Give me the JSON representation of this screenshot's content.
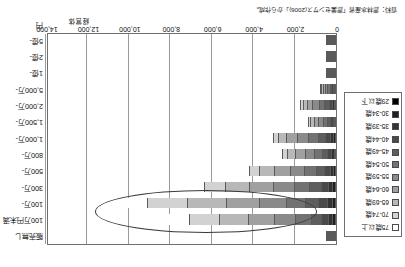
{
  "figure": {
    "source_note": "資料：農林水産省「農業センサス(2006)」から作成。",
    "axis_unit": "経営体",
    "y_axis_unit": "円"
  },
  "chart_data": {
    "type": "bar",
    "subtype": "stacked-horizontal-bar",
    "title": "",
    "xlabel": "経営体",
    "ylabel": "円",
    "xlim": [
      0,
      14000
    ],
    "grid": true,
    "legend_position": "left",
    "xticks": [
      0,
      2000,
      4000,
      6000,
      8000,
      10000,
      12000,
      14000
    ],
    "xtick_labels": [
      "0",
      "2,000",
      "4,000",
      "6,000",
      "8,000",
      "10,000",
      "12,000",
      "14,000"
    ],
    "categories": [
      "販売無し",
      "100万円未満",
      "100万-",
      "300万-",
      "500万-",
      "800万-",
      "1,000万-",
      "1,500万-",
      "2,000万-",
      "5,000万-",
      "1億-",
      "2億-",
      "5億-"
    ],
    "series": [
      {
        "name": "29歳以下",
        "color": "#000000",
        "values": [
          55,
          60,
          70,
          62,
          50,
          40,
          55,
          28,
          35,
          22,
          10,
          6,
          4
        ]
      },
      {
        "name": "30-34歳",
        "color": "#1f1f1f",
        "values": [
          30,
          120,
          140,
          120,
          95,
          70,
          95,
          45,
          60,
          35,
          14,
          7,
          4
        ]
      },
      {
        "name": "35-39歳",
        "color": "#333333",
        "values": [
          25,
          200,
          240,
          210,
          160,
          115,
          150,
          70,
          95,
          50,
          18,
          8,
          4
        ]
      },
      {
        "name": "40-44歳",
        "color": "#4a4a4a",
        "values": [
          20,
          330,
          400,
          350,
          265,
          185,
          235,
          110,
          150,
          72,
          22,
          9,
          4
        ]
      },
      {
        "name": "45-49歳",
        "color": "#5e5e5e",
        "values": [
          18,
          520,
          640,
          545,
          410,
          280,
          350,
          160,
          215,
          95,
          26,
          10,
          4
        ]
      },
      {
        "name": "50-54歳",
        "color": "#727272",
        "values": [
          16,
          760,
          930,
          760,
          560,
          370,
          455,
          205,
          270,
          112,
          28,
          10,
          3
        ]
      },
      {
        "name": "55-59歳",
        "color": "#8a8a8a",
        "values": [
          15,
          1010,
          1280,
          1000,
          700,
          445,
          530,
          230,
          300,
          120,
          28,
          9,
          3
        ]
      },
      {
        "name": "60-64歳",
        "color": "#a0a0a0",
        "values": [
          14,
          1230,
          1620,
          1150,
          760,
          460,
          525,
          215,
          275,
          105,
          24,
          7,
          2
        ]
      },
      {
        "name": "65-69歳",
        "color": "#b8b8b8",
        "values": [
          12,
          1410,
          1900,
          1180,
          700,
          390,
          420,
          160,
          200,
          72,
          16,
          5,
          2
        ]
      },
      {
        "name": "70-74歳",
        "color": "#d2d2d2",
        "values": [
          10,
          1480,
          1900,
          980,
          500,
          250,
          250,
          90,
          110,
          38,
          8,
          3,
          1
        ]
      },
      {
        "name": "75歳以上",
        "color": "#ffffff",
        "values": [
          8,
          1880,
          2380,
          1040,
          430,
          180,
          165,
          55,
          65,
          20,
          4,
          1,
          1
        ]
      }
    ],
    "annotations": [
      {
        "type": "ellipse",
        "label": "highlight-ellipse",
        "covers": [
          "100万円未満",
          "100万-"
        ]
      }
    ]
  },
  "legend": {
    "items": [
      {
        "label": "75歳以上",
        "color": "#ffffff"
      },
      {
        "label": "70-74歳",
        "color": "#d2d2d2"
      },
      {
        "label": "65-69歳",
        "color": "#b8b8b8"
      },
      {
        "label": "60-64歳",
        "color": "#a0a0a0"
      },
      {
        "label": "55-59歳",
        "color": "#8a8a8a"
      },
      {
        "label": "50-54歳",
        "color": "#727272"
      },
      {
        "label": "45-49歳",
        "color": "#5e5e5e"
      },
      {
        "label": "40-44歳",
        "color": "#4a4a4a"
      },
      {
        "label": "35-39歳",
        "color": "#333333"
      },
      {
        "label": "30-34歳",
        "color": "#1f1f1f"
      },
      {
        "label": "29歳以下",
        "color": "#000000"
      }
    ]
  }
}
